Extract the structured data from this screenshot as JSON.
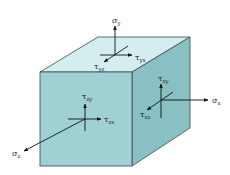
{
  "diagram": {
    "colors": {
      "front_face": "#9fd0d3",
      "top_face": "#d4eef0",
      "right_face": "#88c0c4",
      "edge": "#3a4a4c",
      "arrow": "#111111"
    },
    "labels": {
      "sigma_y": {
        "sym": "σ",
        "sub": "y"
      },
      "tau_yx": {
        "sym": "τ",
        "sub": "yx"
      },
      "tau_yz": {
        "sym": "τ",
        "sub": "yz"
      },
      "tau_xy": {
        "sym": "τ",
        "sub": "xy"
      },
      "sigma_x": {
        "sym": "σ",
        "sub": "x"
      },
      "tau_xz": {
        "sym": "τ",
        "sub": "xz"
      },
      "tau_zy": {
        "sym": "τ",
        "sub": "zy"
      },
      "tau_zx": {
        "sym": "τ",
        "sub": "zx"
      },
      "sigma_z": {
        "sym": "σ",
        "sub": "z"
      }
    }
  }
}
